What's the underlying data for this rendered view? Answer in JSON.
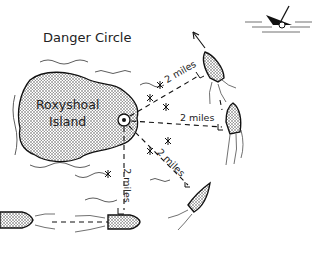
{
  "title": "Danger Circle",
  "island": {
    "line1": "Roxyshoal",
    "line2": "Island"
  },
  "distances": [
    {
      "label": "2 miles",
      "direction": "north-east"
    },
    {
      "label": "2 miles",
      "direction": "east"
    },
    {
      "label": "2 miles",
      "direction": "south-east"
    },
    {
      "label": "2 miles",
      "direction": "south"
    }
  ],
  "icons": [
    "lighthouse-icon",
    "boat-icon",
    "shipwreck-icon",
    "rock-hazard-icon",
    "direction-arrow-icon"
  ]
}
